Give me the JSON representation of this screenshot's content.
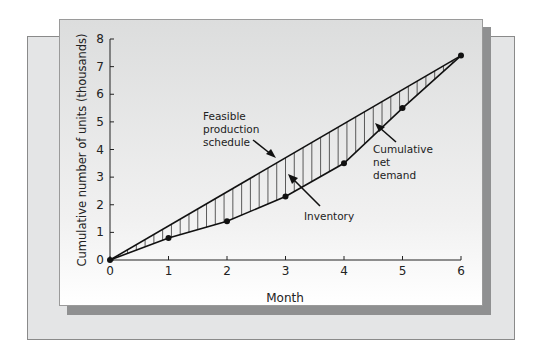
{
  "chart_data": {
    "type": "line",
    "title": "",
    "xlabel": "Month",
    "ylabel": "Cumulative number of units (thousands)",
    "x": [
      0,
      1,
      2,
      3,
      4,
      5,
      6
    ],
    "xlim": [
      0,
      6
    ],
    "ylim": [
      0,
      8
    ],
    "xticks": [
      "0",
      "1",
      "2",
      "3",
      "4",
      "5",
      "6"
    ],
    "yticks": [
      "0",
      "1",
      "2",
      "3",
      "4",
      "5",
      "6",
      "7",
      "8"
    ],
    "grid": false,
    "legend": null,
    "series": [
      {
        "name": "Feasible production schedule",
        "values": [
          0,
          1.25,
          2.5,
          3.75,
          5.0,
          6.25,
          7.4
        ],
        "style": "straight line"
      },
      {
        "name": "Cumulative net demand",
        "values": [
          0,
          0.8,
          1.4,
          2.3,
          3.5,
          5.5,
          7.4
        ],
        "markers": true
      }
    ],
    "shaded_region": {
      "name": "Inventory",
      "between": [
        "Feasible production schedule",
        "Cumulative net demand"
      ],
      "pattern": "vertical hatching"
    },
    "annotations": [
      {
        "text": "Feasible production schedule",
        "lines": [
          "Feasible",
          "production",
          "schedule"
        ]
      },
      {
        "text": "Inventory"
      },
      {
        "text": "Cumulative net demand",
        "lines": [
          "Cumulative",
          "net",
          "demand"
        ]
      }
    ]
  },
  "labels": {
    "xlabel": "Month",
    "ylabel": "Cumulative number of units (thousands)",
    "feasible": [
      "Feasible",
      "production",
      "schedule"
    ],
    "inventory": "Inventory",
    "demand": [
      "Cumulative",
      "net",
      "demand"
    ]
  }
}
